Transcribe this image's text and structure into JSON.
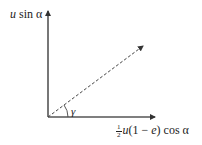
{
  "diagram": {
    "type": "velocity-components",
    "labels": {
      "vertical_axis": {
        "var": "u",
        "rest": " sin α"
      },
      "horizontal_axis": {
        "frac_num": "1",
        "frac_den": "2",
        "var_u": "u",
        "paren_open": "(1 − ",
        "var_e": "e",
        "paren_close": ") cos α"
      },
      "angle": "γ"
    },
    "colors": {
      "axis": "#555555",
      "dashed": "#444444",
      "text": "#222222"
    }
  }
}
